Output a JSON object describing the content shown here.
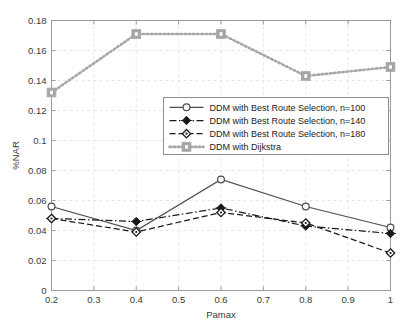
{
  "chart_data": {
    "type": "line",
    "title": "",
    "xlabel": "Pamax",
    "ylabel": "%NAR",
    "x": [
      0.2,
      0.4,
      0.6,
      0.8,
      1.0
    ],
    "xlim": [
      0.2,
      1.0
    ],
    "ylim": [
      0,
      0.18
    ],
    "xticks": [
      "0.2",
      "0.3",
      "0.4",
      "0.5",
      "0.6",
      "0.7",
      "0.8",
      "0.9",
      "1"
    ],
    "xtick_values": [
      0.2,
      0.3,
      0.4,
      0.5,
      0.6,
      0.7,
      0.8,
      0.9,
      1.0
    ],
    "yticks": [
      "0",
      "0.02",
      "0.04",
      "0.06",
      "0.08",
      "0.1",
      "0.12",
      "0.14",
      "0.16",
      "0.18"
    ],
    "ytick_values": [
      0,
      0.02,
      0.04,
      0.06,
      0.08,
      0.1,
      0.12,
      0.14,
      0.16,
      0.18
    ],
    "grid": true,
    "legend_position": "center-right",
    "series": [
      {
        "name": "DDM with Best Route Selection, n=100",
        "values": [
          0.056,
          0.04,
          0.074,
          0.056,
          0.042
        ],
        "color": "#4d4d4d",
        "marker": "circle-open",
        "dash": "solid"
      },
      {
        "name": "DDM with Best Route Selection, n=140",
        "values": [
          0.048,
          0.046,
          0.055,
          0.043,
          0.038
        ],
        "color": "#1a1a1a",
        "marker": "diamond-filled",
        "dash": "dashdot"
      },
      {
        "name": "DDM with Best Route Selection, n=180",
        "values": [
          0.048,
          0.039,
          0.052,
          0.045,
          0.025
        ],
        "color": "#1a1a1a",
        "marker": "diamond-open",
        "dash": "dashed"
      },
      {
        "name": "DDM with Dijkstra",
        "values": [
          0.132,
          0.171,
          0.171,
          0.143,
          0.149
        ],
        "color": "#a6a6a6",
        "marker": "square-filled",
        "dash": "dotted"
      }
    ]
  },
  "axes": {
    "grid_color": "#e2e2e2",
    "frame_color": "#9a9a9a",
    "background": "#ffffff"
  },
  "legend": {
    "items": [
      "DDM with Best Route Selection, n=100",
      "DDM with Best Route Selection, n=140",
      "DDM with Best Route Selection, n=180",
      "DDM with Dijkstra"
    ]
  }
}
